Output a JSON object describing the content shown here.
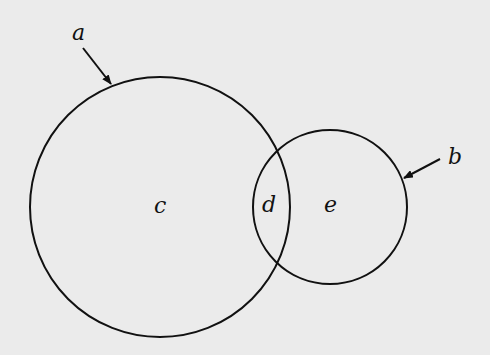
{
  "diagram": {
    "circles": [
      {
        "id": "a",
        "cx": 160,
        "cy": 207,
        "r": 130
      },
      {
        "id": "b",
        "cx": 330,
        "cy": 207,
        "r": 77
      }
    ],
    "labels": {
      "a": "a",
      "b": "b",
      "c": "c",
      "d": "d",
      "e": "e"
    },
    "stroke_color": "#111111",
    "background_color": "#ebebeb"
  }
}
